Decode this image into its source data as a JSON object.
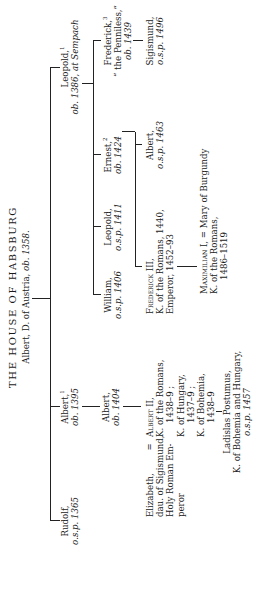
{
  "title": "THE HOUSE OF HABSBURG",
  "root": {
    "name": "Albert, D. of Austria,",
    "note": "ob. 1358."
  },
  "persons": {
    "rudolf": {
      "name": "Rudolf,",
      "note": "o.s.p. 1365"
    },
    "albert1": {
      "name": "Albert,",
      "sup": "1",
      "note": "ob. 1395"
    },
    "leopold1": {
      "name": "Leopold,",
      "sup": "1",
      "note": "ob. 1386, at Sempach"
    },
    "albert_1404": {
      "name": "Albert,",
      "note": "ob. 1404"
    },
    "william": {
      "name": "William,",
      "note": "o.s.p. 1406"
    },
    "leopold_1411": {
      "name": "Leopold,",
      "note": "o.s.p. 1411"
    },
    "ernest": {
      "name": "Ernest,",
      "sup": "2",
      "note": "ob. 1424"
    },
    "frederick": {
      "name": "Frederick,",
      "sup": "3",
      "line2": "“ the Penniless,”",
      "note": "ob. 1439"
    },
    "elizabeth": {
      "name": "Elizabeth,",
      "eq": "=",
      "line2": "dau. of Sigismund,",
      "line3": "Holy Roman Em-",
      "line4": "peror"
    },
    "albert2": {
      "name": "Albert II,",
      "line2": "K. of the Romans,",
      "line3": "1438–9 ;",
      "line4": "K. of Hungary,",
      "line5": "1437–9 ;",
      "line6": "K. of Bohemia,",
      "line7": "1438–9"
    },
    "frederick3": {
      "name": "Frederick III,",
      "line2": "K. of the Romans, 1440,",
      "line3": "Emperor, 1452–93"
    },
    "albert_1463": {
      "name": "Albert,",
      "note": "o.s.p. 1463"
    },
    "sigismund": {
      "name": "Sigismund,",
      "note": "o.s.p. 1496"
    },
    "ladislas": {
      "name": "Ladislas Postumus,",
      "line2": "K. of Bohemia and Hungary,",
      "note": "o.s.p. 1457"
    },
    "maximilian": {
      "name": "Maximilian I,",
      "eq": "= Mary of Burgundy",
      "line2": "K. of the Romans,",
      "line3": "1486–1519"
    }
  }
}
